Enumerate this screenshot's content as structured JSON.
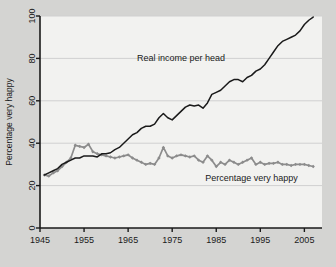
{
  "chart_data": {
    "type": "line",
    "title": "",
    "subtitle": "",
    "xlabel": "",
    "ylabel": "Percentage very happy",
    "xlim": [
      1945,
      2009
    ],
    "ylim": [
      0,
      100
    ],
    "grid": true,
    "grid_axis": "y",
    "legend_position": "inline-annotations",
    "xticks": [
      "1945",
      "1955",
      "1965",
      "1975",
      "1985",
      "1995",
      "2005"
    ],
    "xtick_values": [
      1945,
      1955,
      1965,
      1975,
      1985,
      1995,
      2005
    ],
    "yticks": [
      "0",
      "20",
      "40",
      "60",
      "80",
      "100"
    ],
    "ytick_values": [
      0,
      20,
      40,
      60,
      80,
      100
    ],
    "annotations": [
      {
        "text": "Real income per head",
        "x": 1977,
        "y": 79
      },
      {
        "text": "Percentage very happy",
        "x": 1993,
        "y": 22
      }
    ],
    "colors": {
      "income_line": "#1a1a1a",
      "happy_line": "#8c8c8c",
      "plot_background": "#f2f2f0",
      "figure_background": "#d4d4d2",
      "gridline": "#d0d0d0",
      "axis": "#1a1a1a",
      "text": "#1a1a1a"
    },
    "series": [
      {
        "name": "Real income per head",
        "marker": "none",
        "color": "#1a1a1a",
        "x": [
          1946,
          1947,
          1948,
          1949,
          1950,
          1951,
          1952,
          1953,
          1954,
          1955,
          1956,
          1957,
          1958,
          1959,
          1960,
          1961,
          1962,
          1963,
          1964,
          1965,
          1966,
          1967,
          1968,
          1969,
          1970,
          1971,
          1972,
          1973,
          1974,
          1975,
          1976,
          1977,
          1978,
          1979,
          1980,
          1981,
          1982,
          1983,
          1984,
          1985,
          1986,
          1987,
          1988,
          1989,
          1990,
          1991,
          1992,
          1993,
          1994,
          1995,
          1996,
          1997,
          1998,
          1999,
          2000,
          2001,
          2002,
          2003,
          2004,
          2005,
          2006,
          2007
        ],
        "y": [
          25,
          26,
          27,
          28,
          30,
          31,
          32,
          33,
          33,
          34,
          34,
          34,
          33.5,
          35,
          35,
          35.5,
          37,
          38,
          40,
          42,
          44,
          45,
          47,
          48,
          48,
          49,
          52,
          54,
          52,
          51,
          53,
          55,
          57,
          58,
          57.5,
          58,
          56.5,
          59,
          63,
          64,
          65,
          67,
          69,
          70,
          70,
          69,
          71,
          72,
          74,
          75,
          77,
          80,
          83,
          86,
          88,
          89,
          90,
          91,
          93,
          96,
          98,
          99.5
        ]
      },
      {
        "name": "Percentage very happy",
        "marker": "diamond",
        "color": "#8c8c8c",
        "x": [
          1946,
          1947,
          1948,
          1949,
          1950,
          1951,
          1952,
          1953,
          1954,
          1955,
          1956,
          1957,
          1958,
          1959,
          1960,
          1961,
          1962,
          1963,
          1964,
          1965,
          1966,
          1967,
          1968,
          1969,
          1970,
          1971,
          1972,
          1973,
          1974,
          1975,
          1976,
          1977,
          1978,
          1979,
          1980,
          1981,
          1982,
          1983,
          1984,
          1985,
          1986,
          1987,
          1988,
          1989,
          1990,
          1991,
          1992,
          1993,
          1994,
          1995,
          1996,
          1997,
          1998,
          1999,
          2000,
          2001,
          2002,
          2003,
          2004,
          2005,
          2006,
          2007
        ],
        "y": [
          25,
          24.5,
          26,
          27,
          29,
          31,
          33,
          39,
          38.5,
          38,
          39.5,
          36,
          35,
          34.5,
          34,
          33.5,
          33,
          33.5,
          34,
          34.5,
          33,
          32,
          31,
          30,
          30.5,
          30,
          33,
          38,
          34,
          33,
          34,
          34.5,
          34,
          33.5,
          34,
          32,
          31,
          34,
          32,
          29,
          31,
          30,
          32,
          31,
          30,
          31,
          32,
          33,
          30,
          31,
          30,
          30.5,
          30.5,
          31,
          30,
          30,
          29.5,
          30,
          30,
          30,
          29.5,
          29
        ]
      }
    ]
  },
  "axis_text": {
    "ylabel": "Percentage very happy"
  }
}
